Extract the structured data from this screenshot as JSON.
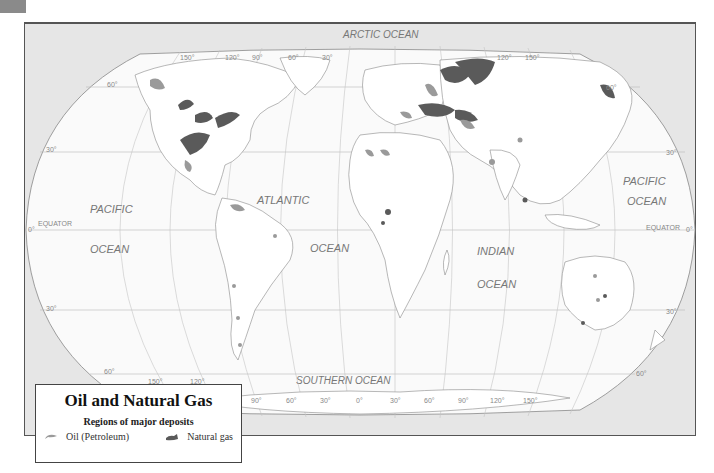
{
  "title": "Oil and Natural Gas",
  "legend": {
    "title": "Oil and Natural Gas",
    "subtitle": "Regions of major deposits",
    "items": [
      {
        "label": "Oil (Petroleum)",
        "color": "#9a9a9a"
      },
      {
        "label": "Natural gas",
        "color": "#5a5a5a"
      }
    ]
  },
  "oceans": {
    "arctic": "ARCTIC OCEAN",
    "pacific_west_1": "PACIFIC",
    "pacific_west_2": "OCEAN",
    "atlantic_1": "ATLANTIC",
    "atlantic_2": "OCEAN",
    "indian_1": "INDIAN",
    "indian_2": "OCEAN",
    "pacific_east_1": "PACIFIC",
    "pacific_east_2": "OCEAN",
    "southern": "SOUTHERN OCEAN"
  },
  "grid": {
    "equator_left": "EQUATOR",
    "equator_right": "EQUATOR",
    "lat_0_left": "0°",
    "lat_0_right": "0°",
    "lat_30n_left": "30°",
    "lat_30n_right": "30°",
    "lat_30s_left": "30°",
    "lat_30s_right": "30°",
    "lat_60n_left": "60°",
    "lat_60n_right": "60°",
    "lat_60s_left": "60°",
    "lat_60s_right": "60°",
    "top_lons": [
      "150°",
      "120°",
      "90°",
      "60°",
      "30°",
      "120°",
      "150°"
    ],
    "bottom_lons": [
      "150°",
      "120°",
      "90°",
      "60°",
      "30°",
      "0°",
      "30°",
      "60°",
      "90°",
      "120°",
      "150°"
    ]
  },
  "colors": {
    "oil": "#9a9a9a",
    "gas": "#5a5a5a",
    "land": "#ffffff",
    "ocean": "#f7f7f7",
    "frame_bg": "#e6e6e6"
  }
}
